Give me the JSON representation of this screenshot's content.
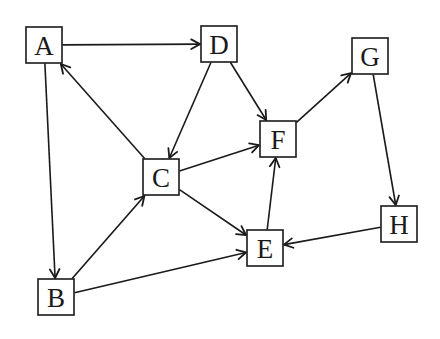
{
  "diagram": {
    "type": "directed-graph",
    "colors": {
      "stroke": "#1a1a1a",
      "background": "#ffffff",
      "node_fill": "#ffffff"
    },
    "node_size": 36,
    "nodes": [
      {
        "id": "A",
        "label": "A",
        "x": 44,
        "y": 45
      },
      {
        "id": "B",
        "label": "B",
        "x": 56,
        "y": 297
      },
      {
        "id": "C",
        "label": "C",
        "x": 161,
        "y": 177
      },
      {
        "id": "D",
        "label": "D",
        "x": 219,
        "y": 44
      },
      {
        "id": "E",
        "label": "E",
        "x": 265,
        "y": 248
      },
      {
        "id": "F",
        "label": "F",
        "x": 278,
        "y": 139
      },
      {
        "id": "G",
        "label": "G",
        "x": 370,
        "y": 56
      },
      {
        "id": "H",
        "label": "H",
        "x": 399,
        "y": 224
      }
    ],
    "edges": [
      {
        "from": "A",
        "to": "D"
      },
      {
        "from": "A",
        "to": "B"
      },
      {
        "from": "C",
        "to": "A"
      },
      {
        "from": "D",
        "to": "C"
      },
      {
        "from": "D",
        "to": "F"
      },
      {
        "from": "C",
        "to": "F"
      },
      {
        "from": "C",
        "to": "E"
      },
      {
        "from": "B",
        "to": "C"
      },
      {
        "from": "B",
        "to": "E"
      },
      {
        "from": "E",
        "to": "F"
      },
      {
        "from": "F",
        "to": "G"
      },
      {
        "from": "G",
        "to": "H"
      },
      {
        "from": "H",
        "to": "E"
      }
    ]
  }
}
